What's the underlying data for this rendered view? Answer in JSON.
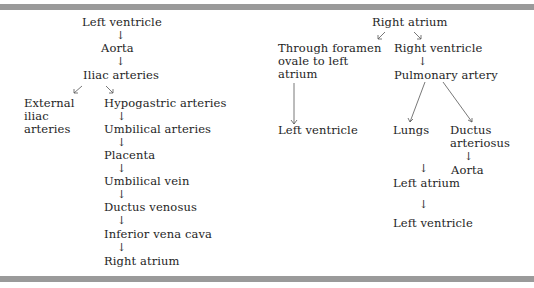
{
  "diagram": {
    "type": "flowchart",
    "left_column": {
      "nodes": [
        {
          "id": "lv",
          "label": "Left ventricle"
        },
        {
          "id": "aorta",
          "label": "Aorta"
        },
        {
          "id": "iliac",
          "label": "Iliac arteries"
        },
        {
          "id": "ext_iliac",
          "label_lines": [
            "External",
            "iliac",
            "arteries"
          ]
        },
        {
          "id": "hypogastric",
          "label": "Hypogastric arteries"
        },
        {
          "id": "umb_art",
          "label": "Umbilical arteries"
        },
        {
          "id": "placenta",
          "label": "Placenta"
        },
        {
          "id": "umb_vein",
          "label": "Umbilical vein"
        },
        {
          "id": "ductus_ven",
          "label": "Ductus venosus"
        },
        {
          "id": "ivc",
          "label": "Inferior vena cava"
        },
        {
          "id": "ra",
          "label": "Right atrium"
        }
      ],
      "edges": [
        [
          "lv",
          "aorta"
        ],
        [
          "aorta",
          "iliac"
        ],
        [
          "iliac",
          "ext_iliac"
        ],
        [
          "iliac",
          "hypogastric"
        ],
        [
          "hypogastric",
          "umb_art"
        ],
        [
          "umb_art",
          "placenta"
        ],
        [
          "placenta",
          "umb_vein"
        ],
        [
          "umb_vein",
          "ductus_ven"
        ],
        [
          "ductus_ven",
          "ivc"
        ],
        [
          "ivc",
          "ra"
        ]
      ]
    },
    "right_column": {
      "nodes": [
        {
          "id": "ra2",
          "label": "Right atrium"
        },
        {
          "id": "foramen",
          "label_lines": [
            "Through foramen",
            "ovale to left",
            "atrium"
          ]
        },
        {
          "id": "rv",
          "label": "Right ventricle"
        },
        {
          "id": "pa",
          "label": "Pulmonary artery"
        },
        {
          "id": "lv2",
          "label": "Left ventricle"
        },
        {
          "id": "lungs",
          "label": "Lungs"
        },
        {
          "id": "ductus_art",
          "label_lines": [
            "Ductus",
            "arteriosus"
          ]
        },
        {
          "id": "aorta2",
          "label": "Aorta"
        },
        {
          "id": "la",
          "label": "Left atrium"
        },
        {
          "id": "lv3",
          "label": "Left ventricle"
        }
      ],
      "edges": [
        [
          "ra2",
          "foramen"
        ],
        [
          "ra2",
          "rv"
        ],
        [
          "foramen",
          "lv2"
        ],
        [
          "rv",
          "pa"
        ],
        [
          "pa",
          "lungs"
        ],
        [
          "pa",
          "ductus_art"
        ],
        [
          "ductus_art",
          "aorta2"
        ],
        [
          "lungs",
          "la"
        ],
        [
          "la",
          "lv3"
        ]
      ]
    },
    "arrow_glyph": "↓",
    "colors": {
      "rule": "#9a9a9a",
      "text": "#1e1e1e",
      "background": "#ffffff"
    }
  }
}
